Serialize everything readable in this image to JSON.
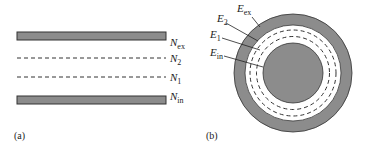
{
  "panel_a": {
    "label": "(a)",
    "layers": [
      {
        "id": "ex",
        "symbol": "N",
        "subscript": "ex",
        "style": "solid-bar"
      },
      {
        "id": "2",
        "symbol": "N",
        "subscript": "2",
        "style": "dashed"
      },
      {
        "id": "1",
        "symbol": "N",
        "subscript": "1",
        "style": "dashed"
      },
      {
        "id": "in",
        "symbol": "N",
        "subscript": "in",
        "style": "solid-bar"
      }
    ]
  },
  "panel_b": {
    "label": "(b)",
    "layers": [
      {
        "id": "ex",
        "symbol": "E",
        "subscript": "ex",
        "style": "solid-ring"
      },
      {
        "id": "2",
        "symbol": "E",
        "subscript": "2",
        "style": "dashed-circle"
      },
      {
        "id": "1",
        "symbol": "E",
        "subscript": "1",
        "style": "dashed-circle"
      },
      {
        "id": "in",
        "symbol": "E",
        "subscript": "in",
        "style": "solid-disk"
      }
    ]
  },
  "colors": {
    "fill_gray": "#8c8c8c",
    "stroke": "#333333",
    "background": "#ffffff"
  }
}
